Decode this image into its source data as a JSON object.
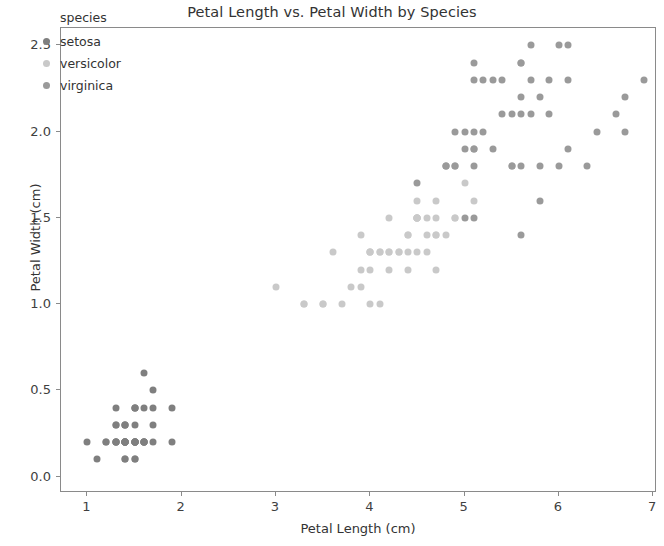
{
  "chart_data": {
    "type": "scatter",
    "title": "Petal Length vs. Petal Width by Species",
    "xlabel": "Petal Length (cm)",
    "ylabel": "Petal Width (cm)",
    "xlim": [
      0.72,
      7.04
    ],
    "ylim": [
      -0.095,
      2.6
    ],
    "xticks": [
      1,
      2,
      3,
      4,
      5,
      6,
      7
    ],
    "xticklabels": [
      "1",
      "2",
      "3",
      "4",
      "5",
      "6",
      "7"
    ],
    "yticks": [
      0.0,
      0.5,
      1.0,
      1.5,
      2.0,
      2.5
    ],
    "yticklabels": [
      "0.0",
      "0.5",
      "1.0",
      "1.5",
      "2.0",
      "2.5"
    ],
    "grid": false,
    "legend_position": "upper left",
    "legend_title": "species",
    "series": [
      {
        "name": "setosa",
        "color": "#7f7f7f",
        "points": [
          [
            1.4,
            0.2
          ],
          [
            1.4,
            0.2
          ],
          [
            1.3,
            0.2
          ],
          [
            1.5,
            0.2
          ],
          [
            1.4,
            0.2
          ],
          [
            1.7,
            0.4
          ],
          [
            1.4,
            0.3
          ],
          [
            1.5,
            0.2
          ],
          [
            1.4,
            0.2
          ],
          [
            1.5,
            0.1
          ],
          [
            1.5,
            0.2
          ],
          [
            1.6,
            0.2
          ],
          [
            1.4,
            0.1
          ],
          [
            1.1,
            0.1
          ],
          [
            1.2,
            0.2
          ],
          [
            1.5,
            0.4
          ],
          [
            1.3,
            0.4
          ],
          [
            1.4,
            0.3
          ],
          [
            1.7,
            0.3
          ],
          [
            1.5,
            0.3
          ],
          [
            1.7,
            0.2
          ],
          [
            1.5,
            0.4
          ],
          [
            1.0,
            0.2
          ],
          [
            1.7,
            0.5
          ],
          [
            1.9,
            0.2
          ],
          [
            1.6,
            0.2
          ],
          [
            1.6,
            0.4
          ],
          [
            1.5,
            0.2
          ],
          [
            1.4,
            0.2
          ],
          [
            1.6,
            0.2
          ],
          [
            1.6,
            0.2
          ],
          [
            1.5,
            0.4
          ],
          [
            1.5,
            0.1
          ],
          [
            1.4,
            0.2
          ],
          [
            1.5,
            0.2
          ],
          [
            1.2,
            0.2
          ],
          [
            1.3,
            0.2
          ],
          [
            1.4,
            0.1
          ],
          [
            1.3,
            0.2
          ],
          [
            1.5,
            0.2
          ],
          [
            1.3,
            0.3
          ],
          [
            1.3,
            0.3
          ],
          [
            1.3,
            0.2
          ],
          [
            1.6,
            0.6
          ],
          [
            1.9,
            0.4
          ],
          [
            1.4,
            0.3
          ],
          [
            1.6,
            0.2
          ],
          [
            1.4,
            0.2
          ],
          [
            1.5,
            0.2
          ],
          [
            1.4,
            0.2
          ]
        ]
      },
      {
        "name": "versicolor",
        "color": "#c9c9c9",
        "points": [
          [
            4.7,
            1.4
          ],
          [
            4.5,
            1.5
          ],
          [
            4.9,
            1.5
          ],
          [
            4.0,
            1.3
          ],
          [
            4.6,
            1.5
          ],
          [
            4.5,
            1.3
          ],
          [
            4.7,
            1.6
          ],
          [
            3.3,
            1.0
          ],
          [
            4.6,
            1.3
          ],
          [
            3.9,
            1.4
          ],
          [
            3.5,
            1.0
          ],
          [
            4.2,
            1.5
          ],
          [
            4.0,
            1.0
          ],
          [
            4.7,
            1.4
          ],
          [
            3.6,
            1.3
          ],
          [
            4.4,
            1.4
          ],
          [
            4.5,
            1.5
          ],
          [
            4.1,
            1.0
          ],
          [
            4.5,
            1.5
          ],
          [
            3.9,
            1.1
          ],
          [
            4.8,
            1.8
          ],
          [
            4.0,
            1.3
          ],
          [
            4.9,
            1.5
          ],
          [
            4.7,
            1.2
          ],
          [
            4.3,
            1.3
          ],
          [
            4.4,
            1.4
          ],
          [
            4.8,
            1.4
          ],
          [
            5.0,
            1.7
          ],
          [
            4.5,
            1.5
          ],
          [
            3.5,
            1.0
          ],
          [
            3.8,
            1.1
          ],
          [
            3.7,
            1.0
          ],
          [
            3.9,
            1.2
          ],
          [
            5.1,
            1.6
          ],
          [
            4.5,
            1.5
          ],
          [
            4.5,
            1.6
          ],
          [
            4.7,
            1.5
          ],
          [
            4.4,
            1.3
          ],
          [
            4.1,
            1.3
          ],
          [
            4.0,
            1.3
          ],
          [
            4.4,
            1.2
          ],
          [
            4.6,
            1.4
          ],
          [
            4.0,
            1.2
          ],
          [
            3.3,
            1.0
          ],
          [
            4.2,
            1.3
          ],
          [
            4.2,
            1.2
          ],
          [
            4.2,
            1.3
          ],
          [
            4.3,
            1.3
          ],
          [
            3.0,
            1.1
          ],
          [
            4.1,
            1.3
          ]
        ]
      },
      {
        "name": "virginica",
        "color": "#9a9a9a",
        "points": [
          [
            6.0,
            2.5
          ],
          [
            5.1,
            1.9
          ],
          [
            5.9,
            2.1
          ],
          [
            5.6,
            1.8
          ],
          [
            5.8,
            2.2
          ],
          [
            6.6,
            2.1
          ],
          [
            4.5,
            1.7
          ],
          [
            6.3,
            1.8
          ],
          [
            5.8,
            1.8
          ],
          [
            6.1,
            2.5
          ],
          [
            5.1,
            2.0
          ],
          [
            5.3,
            1.9
          ],
          [
            5.5,
            2.1
          ],
          [
            5.0,
            2.0
          ],
          [
            5.1,
            2.4
          ],
          [
            5.3,
            2.3
          ],
          [
            5.5,
            1.8
          ],
          [
            6.7,
            2.2
          ],
          [
            6.9,
            2.3
          ],
          [
            5.0,
            1.5
          ],
          [
            5.7,
            2.3
          ],
          [
            4.9,
            2.0
          ],
          [
            6.7,
            2.0
          ],
          [
            4.9,
            1.8
          ],
          [
            5.7,
            2.1
          ],
          [
            6.0,
            1.8
          ],
          [
            4.8,
            1.8
          ],
          [
            4.9,
            1.8
          ],
          [
            5.6,
            2.1
          ],
          [
            5.8,
            1.6
          ],
          [
            6.1,
            1.9
          ],
          [
            6.4,
            2.0
          ],
          [
            5.6,
            2.2
          ],
          [
            5.1,
            1.5
          ],
          [
            5.6,
            1.4
          ],
          [
            6.1,
            2.3
          ],
          [
            5.6,
            2.4
          ],
          [
            5.5,
            1.8
          ],
          [
            4.8,
            1.8
          ],
          [
            5.4,
            2.1
          ],
          [
            5.6,
            2.4
          ],
          [
            5.1,
            2.3
          ],
          [
            5.1,
            1.9
          ],
          [
            5.9,
            2.3
          ],
          [
            5.7,
            2.5
          ],
          [
            5.2,
            2.3
          ],
          [
            5.0,
            1.9
          ],
          [
            5.2,
            2.0
          ],
          [
            5.4,
            2.3
          ],
          [
            5.1,
            1.8
          ]
        ]
      }
    ]
  }
}
